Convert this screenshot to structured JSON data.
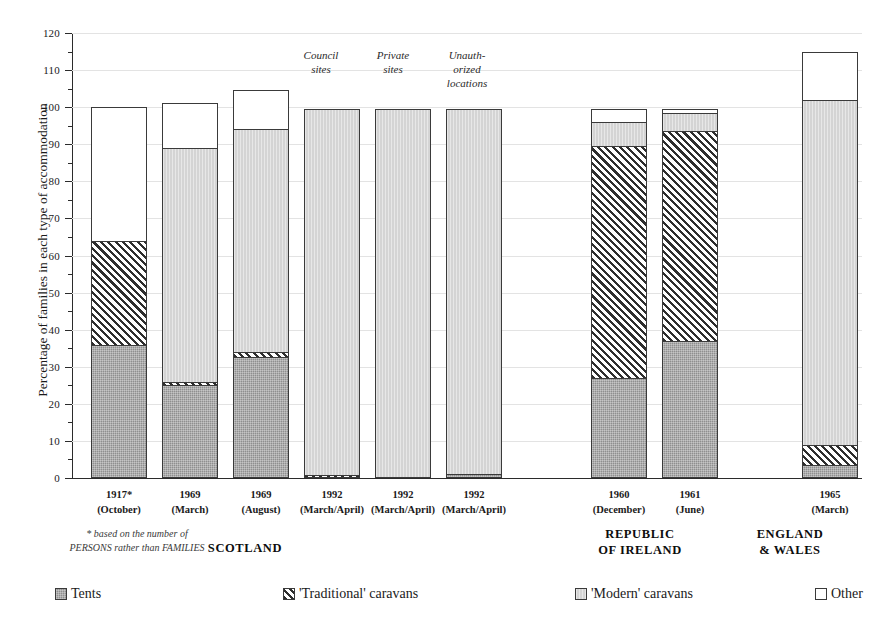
{
  "chart_data": {
    "type": "bar",
    "title": "",
    "xlabel": "",
    "ylabel": "Percentage of families in each type of accommodation",
    "ylim": [
      0,
      120
    ],
    "ytick_step": 10,
    "yticks": [
      0,
      10,
      20,
      30,
      40,
      50,
      60,
      70,
      80,
      90,
      100,
      110,
      120
    ],
    "grid": true,
    "stacked": true,
    "legend_position": "bottom",
    "series": [
      {
        "name": "Tents",
        "key": "tents",
        "pattern": "solid-dark-gray",
        "color": "#8f8f8f",
        "values": [
          36.0,
          25.0,
          32.5,
          0.0,
          0.0,
          1.0,
          27.0,
          37.0,
          3.5
        ]
      },
      {
        "name": "'Traditional' caravans",
        "key": "trad",
        "pattern": "diagonal-hatch",
        "color": "#2e2e2e",
        "values": [
          28.0,
          1.0,
          1.5,
          0.7,
          0.0,
          0.0,
          62.5,
          56.5,
          5.5
        ]
      },
      {
        "name": "'Modern' caravans",
        "key": "modern",
        "pattern": "solid-light-gray",
        "color": "#d4d4d4",
        "values": [
          0.0,
          63.0,
          60.0,
          98.8,
          99.5,
          98.5,
          6.5,
          5.0,
          93.0
        ]
      },
      {
        "name": "Other",
        "key": "other",
        "pattern": "white",
        "color": "#ffffff",
        "values": [
          36.0,
          12.0,
          10.5,
          0.0,
          0.0,
          0.0,
          3.5,
          1.0,
          13.0
        ]
      }
    ],
    "categories": [
      {
        "year": "1917*",
        "period": "(October)",
        "annotation": "",
        "region": "SCOTLAND"
      },
      {
        "year": "1969",
        "period": "(March)",
        "annotation": "",
        "region": "SCOTLAND"
      },
      {
        "year": "1969",
        "period": "(August)",
        "annotation": "",
        "region": "SCOTLAND"
      },
      {
        "year": "1992",
        "period": "(March/April)",
        "annotation": "Council\nsites",
        "region": "SCOTLAND"
      },
      {
        "year": "1992",
        "period": "(March/April)",
        "annotation": "Private\nsites",
        "region": "SCOTLAND"
      },
      {
        "year": "1992",
        "period": "(March/April)",
        "annotation": "Unauth-\norized\nlocations",
        "region": "SCOTLAND"
      },
      {
        "year": "1960",
        "period": "(December)",
        "annotation": "",
        "region": "REPUBLIC OF IRELAND"
      },
      {
        "year": "1961",
        "period": "(June)",
        "annotation": "",
        "region": "REPUBLIC OF IRELAND"
      },
      {
        "year": "1965",
        "period": "(March)",
        "annotation": "",
        "region": "ENGLAND & WALES"
      }
    ],
    "totals": [
      100.0,
      101.0,
      104.5,
      99.5,
      99.5,
      99.5,
      99.5,
      98.5,
      115.0
    ],
    "annotations": [
      {
        "text": "Council sites",
        "for_category_index": 3
      },
      {
        "text": "Private sites",
        "for_category_index": 4
      },
      {
        "text": "Unauth- orized locations",
        "for_category_index": 5
      }
    ],
    "regions": [
      {
        "label_line1": "SCOTLAND",
        "label_line2": "",
        "categories": [
          0,
          1,
          2,
          3,
          4,
          5
        ]
      },
      {
        "label_line1": "REPUBLIC",
        "label_line2": "OF IRELAND",
        "categories": [
          6,
          7
        ]
      },
      {
        "label_line1": "ENGLAND",
        "label_line2": "& WALES",
        "categories": [
          8
        ]
      }
    ],
    "footnote": "* based on the number of\nPERSONS rather than FAMILIES"
  },
  "axis": {
    "y_title": "Percentage of families in each type of accommodation",
    "y_labels": [
      "0",
      "10",
      "20",
      "30",
      "40",
      "50",
      "60",
      "70",
      "80",
      "90",
      "100",
      "110",
      "120"
    ]
  },
  "annotations": {
    "council_l1": "Council",
    "council_l2": "sites",
    "private_l1": "Private",
    "private_l2": "sites",
    "unauth_l1": "Unauth-",
    "unauth_l2": "orized",
    "unauth_l3": "locations"
  },
  "xlabels": [
    {
      "year": "1917*",
      "period": "(October)"
    },
    {
      "year": "1969",
      "period": "(March)"
    },
    {
      "year": "1969",
      "period": "(August)"
    },
    {
      "year": "1992",
      "period": "(March/April)"
    },
    {
      "year": "1992",
      "period": "(March/April)"
    },
    {
      "year": "1992",
      "period": "(March/April)"
    },
    {
      "year": "1960",
      "period": "(December)"
    },
    {
      "year": "1961",
      "period": "(June)"
    },
    {
      "year": "1965",
      "period": "(March)"
    }
  ],
  "regions": {
    "scotland": "SCOTLAND",
    "roi_l1": "REPUBLIC",
    "roi_l2": "OF IRELAND",
    "ew_l1": "ENGLAND",
    "ew_l2": "& WALES"
  },
  "footnote": {
    "line1": "* based on the number of",
    "line2": "PERSONS rather than FAMILIES"
  },
  "legend": {
    "items": [
      {
        "label": "Tents",
        "swatch": "tents-swatch"
      },
      {
        "label": "'Traditional' caravans",
        "swatch": "traditional-swatch"
      },
      {
        "label": "'Modern' caravans",
        "swatch": "modern-swatch"
      },
      {
        "label": "Other",
        "swatch": "other-swatch"
      }
    ]
  },
  "colors": {
    "tents": "#8f8f8f",
    "traditional_stroke": "#2e2e2e",
    "modern": "#d4d4d4",
    "other": "#ffffff",
    "axis": "#2b2b2b",
    "grid": "#e3e3e3"
  }
}
